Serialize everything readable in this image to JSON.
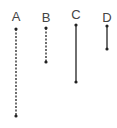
{
  "lines": [
    {
      "label": "A",
      "x": 16,
      "y1": 29,
      "y2": 116,
      "style": "dotted"
    },
    {
      "label": "B",
      "x": 46,
      "y1": 28,
      "y2": 62,
      "style": "dotted"
    },
    {
      "label": "C",
      "x": 76,
      "y1": 25,
      "y2": 82,
      "style": "solid"
    },
    {
      "label": "D",
      "x": 107,
      "y1": 26,
      "y2": 49,
      "style": "solid"
    }
  ],
  "colors": {
    "line": "#222222",
    "label": "#444444"
  }
}
